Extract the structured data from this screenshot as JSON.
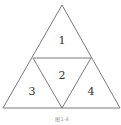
{
  "diagram": {
    "stroke_color": "#6b6b6b",
    "regions": [
      {
        "id": "1",
        "label": "1"
      },
      {
        "id": "2",
        "label": "2"
      },
      {
        "id": "3",
        "label": "3"
      },
      {
        "id": "4",
        "label": "4"
      }
    ],
    "caption": "图1-4"
  }
}
